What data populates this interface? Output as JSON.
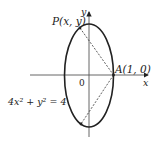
{
  "diagram": {
    "labels": {
      "point_p": "P(x, y)",
      "point_a": "A(1, 0)",
      "origin": "0",
      "x_axis": "x",
      "y_axis": "y",
      "equation": "4x² + y² = 4"
    },
    "colors": {
      "stroke": "#222222",
      "background": "#ffffff"
    }
  }
}
